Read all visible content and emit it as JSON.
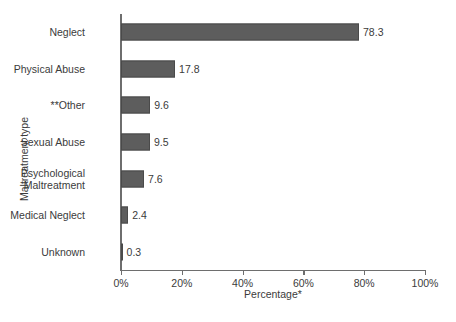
{
  "chart_data": {
    "type": "bar",
    "orientation": "horizontal",
    "title": "",
    "xlabel": "Percentage*",
    "ylabel": "Maltreatment type",
    "categories": [
      "Neglect",
      "Physical Abuse",
      "**Other",
      "Sexual Abuse",
      "Psychological\nMaltreatment",
      "Medical Neglect",
      "Unknown"
    ],
    "values": [
      78.3,
      17.8,
      9.6,
      9.5,
      7.6,
      2.4,
      0.3
    ],
    "value_labels": [
      "78.3",
      "17.8",
      "9.6",
      "9.5",
      "7.6",
      "2.4",
      "0.3"
    ],
    "xlim": [
      0,
      100
    ],
    "xticks": [
      0,
      20,
      40,
      60,
      80,
      100
    ],
    "xtick_labels": [
      "0%",
      "20%",
      "40%",
      "60%",
      "80%",
      "100%"
    ],
    "grid": false,
    "legend": null,
    "bar_color": "#5d5d5d",
    "bar_edge_color": "#4a4a4a",
    "axis_color": "#6e6e6e",
    "text_color": "#3b3b3b",
    "background": "#ffffff"
  }
}
